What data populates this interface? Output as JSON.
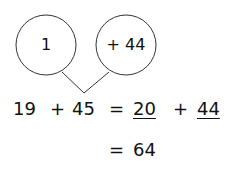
{
  "diagram": {
    "split": {
      "left_circle": "1",
      "right_circle": "+ 44"
    },
    "equation1": {
      "a": "19",
      "op1": "+",
      "b": "45",
      "eq": "=",
      "c": "20",
      "op2": "+",
      "d": "44"
    },
    "equation2": {
      "eq": "=",
      "result": "64"
    }
  }
}
